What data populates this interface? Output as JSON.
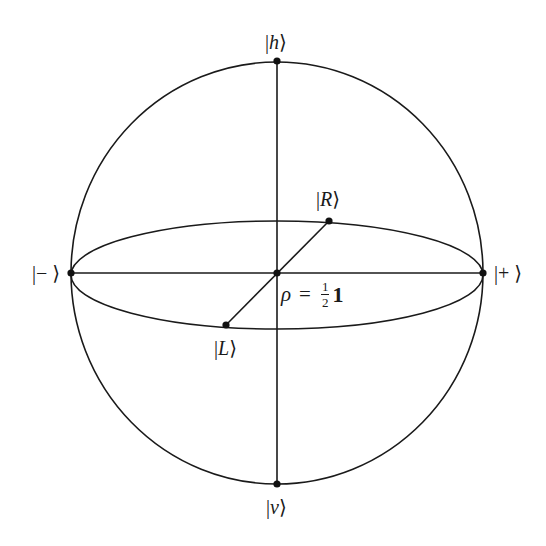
{
  "diagram": {
    "type": "bloch-sphere",
    "stroke_color": "#1a1a1a",
    "center": {
      "x": 277,
      "y": 273
    },
    "sphere": {
      "rx": 206,
      "ry": 211
    },
    "equator": {
      "rx": 206,
      "ry": 54
    },
    "points": {
      "h": {
        "x": 277,
        "y": 61
      },
      "v": {
        "x": 277,
        "y": 484
      },
      "minus": {
        "x": 71,
        "y": 273
      },
      "plus": {
        "x": 483,
        "y": 273
      },
      "R": {
        "x": 329,
        "y": 221
      },
      "L": {
        "x": 226,
        "y": 325
      },
      "center": {
        "x": 277,
        "y": 273
      }
    }
  },
  "labels": {
    "h": {
      "bar": "|",
      "symbol": "h",
      "angle": "⟩"
    },
    "v": {
      "bar": "|",
      "symbol": "v",
      "angle": "⟩"
    },
    "minus": {
      "bar": "|",
      "symbol": "−",
      "angle": "⟩"
    },
    "plus": {
      "bar": "|",
      "symbol": "+",
      "angle": "⟩"
    },
    "R": {
      "bar": "|",
      "symbol": "R",
      "angle": "⟩"
    },
    "L": {
      "bar": "|",
      "symbol": "L",
      "angle": "⟩"
    }
  },
  "center_label": {
    "rho": "ρ",
    "equals": "=",
    "numerator": "1",
    "denominator": "2",
    "identity": "1"
  }
}
